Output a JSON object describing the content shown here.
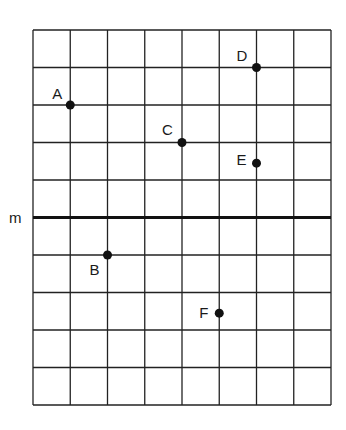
{
  "diagram": {
    "type": "coordinate-grid",
    "grid": {
      "columns": 8,
      "rows": 10,
      "left": 33,
      "top": 30,
      "cell_w": 37.25,
      "cell_h": 37.5,
      "line_color": "#222222"
    },
    "line_m": {
      "label": "m",
      "row": 5
    },
    "points": [
      {
        "label": "A",
        "col": 1,
        "row": 2,
        "label_dx": -18,
        "label_dy": -6
      },
      {
        "label": "B",
        "col": 2,
        "row": 6,
        "label_dx": -18,
        "label_dy": 20
      },
      {
        "label": "C",
        "col": 4,
        "row": 3,
        "label_dx": -20,
        "label_dy": -8
      },
      {
        "label": "D",
        "col": 6,
        "row": 1,
        "label_dx": -20,
        "label_dy": -7
      },
      {
        "label": "E",
        "col": 6,
        "row": 3.55,
        "label_dx": -20,
        "label_dy": 2
      },
      {
        "label": "F",
        "col": 5,
        "row": 7.55,
        "label_dx": -20,
        "label_dy": 5
      }
    ]
  }
}
